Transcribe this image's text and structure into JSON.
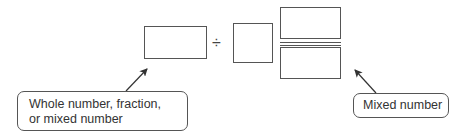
{
  "expression": {
    "operator": "÷",
    "dividend_box": "Whole number, fraction, or mixed number",
    "divisor": "Mixed number"
  },
  "labels": {
    "left": {
      "line1": "Whole number, fraction,",
      "line2": "or mixed number"
    },
    "right": {
      "text": "Mixed number"
    }
  },
  "colors": {
    "stroke": "#555555",
    "text": "#333333"
  }
}
